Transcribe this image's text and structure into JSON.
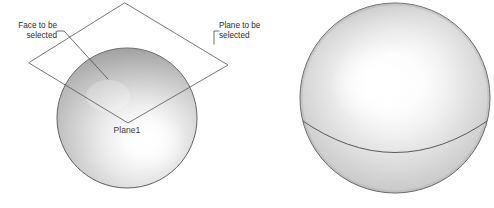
{
  "figure": {
    "background_color": "#ffffff",
    "width": 494,
    "height": 208
  },
  "callouts": [
    {
      "name": "face-callout",
      "line1": "Face to be",
      "line2": "selected",
      "align": "right",
      "text_x": 57,
      "line1_y": 28,
      "line2_y": 38,
      "leader": "M 57 31 L 64 31 L 108 79"
    },
    {
      "name": "plane-callout",
      "line1": "Plane to be",
      "line2": "selected",
      "align": "left",
      "text_x": 219,
      "line1_y": 28,
      "line2_y": 38,
      "leader": "M 219 31 L 214 31 L 214 44"
    }
  ],
  "plane": {
    "name": "construction-plane",
    "label": "Plane1",
    "label_x": 127,
    "label_y": 133,
    "vertices": "125,3 228,65 128,123 29,63",
    "top_vertex": [
      125,
      3
    ],
    "right_vertex": [
      228,
      65
    ],
    "bottom_vertex": [
      128,
      123
    ],
    "left_vertex": [
      29,
      63
    ]
  },
  "spheres": [
    {
      "name": "left-sphere",
      "center_x": 127,
      "center_y": 118,
      "radius": 70,
      "highlight_x": 150,
      "highlight_y": 140,
      "has_parting_curve": false,
      "base_color": "#b9b9b9",
      "highlight_color": "#ffffff",
      "shadow_color": "#9a9a9a"
    },
    {
      "name": "right-sphere",
      "center_x": 395,
      "center_y": 98,
      "radius": 95,
      "highlight_x": 376,
      "highlight_y": 82,
      "has_parting_curve": true,
      "parting_curve": "M 300 119 Q 395 186 490 119",
      "base_color": "#bdbdbd",
      "highlight_color": "#ffffff",
      "shadow_color": "#9e9e9e"
    }
  ],
  "colors": {
    "line_stroke": "#5d5d5d",
    "text_fill": "#2b2b2b",
    "background": "#ffffff"
  }
}
